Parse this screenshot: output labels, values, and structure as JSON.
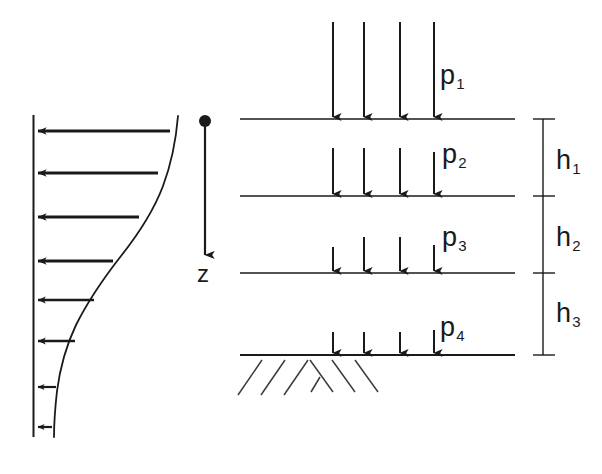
{
  "figure": {
    "stroke_color": "#1a1a1a",
    "background_color": "#ffffff"
  },
  "velocity_profile": {
    "name": "velocity-profile",
    "axis_label": "",
    "arrow_direction": "left",
    "arrow_count": 8,
    "arrows": [
      {
        "y": 131,
        "tip_x": 38,
        "tail_x": 170,
        "head": 9,
        "width": 3.0
      },
      {
        "y": 173,
        "tip_x": 38,
        "tail_x": 158,
        "head": 9,
        "width": 3.0
      },
      {
        "y": 217,
        "tip_x": 38,
        "tail_x": 139,
        "head": 8,
        "width": 2.8
      },
      {
        "y": 261,
        "tip_x": 38,
        "tail_x": 113,
        "head": 8,
        "width": 2.8
      },
      {
        "y": 300,
        "tip_x": 38,
        "tail_x": 94,
        "head": 7,
        "width": 2.6
      },
      {
        "y": 341,
        "tip_x": 38,
        "tail_x": 75,
        "head": 6,
        "width": 2.4
      },
      {
        "y": 387,
        "tip_x": 38,
        "tail_x": 56,
        "head": 5,
        "width": 2.2
      },
      {
        "y": 427,
        "tip_x": 38,
        "tail_x": 52,
        "head": 5,
        "width": 2.2
      }
    ]
  },
  "z_axis": {
    "name": "z-axis",
    "label": "z",
    "origin_marker": "filled-dot",
    "direction": "down"
  },
  "pressure_layers": {
    "name": "pressure-layers",
    "layers": [
      {
        "label": "p",
        "subscript": "1",
        "arrow_top": 22,
        "arrow_bottom": 117,
        "label_x": 440,
        "label_y": 62
      },
      {
        "label": "p",
        "subscript": "2",
        "arrow_top": 148,
        "arrow_bottom": 194,
        "label_x": 442,
        "label_y": 141
      },
      {
        "label": "p",
        "subscript": "3",
        "arrow_top": 237,
        "arrow_bottom": 271,
        "label_x": 442,
        "label_y": 224
      },
      {
        "label": "p",
        "subscript": "4",
        "arrow_top": 330,
        "arrow_bottom": 353,
        "label_x": 440,
        "label_y": 314
      }
    ],
    "arrow_columns_x": [
      333,
      364,
      400,
      434
    ],
    "boundary_lines_y": [
      119,
      196,
      273,
      355
    ],
    "boundary_line_x_start": 240,
    "boundary_line_x_end": 515
  },
  "dimensions": {
    "name": "layer-thickness-dimensions",
    "line_x": 543,
    "ticks_y": [
      119,
      196,
      273,
      355
    ],
    "items": [
      {
        "label": "h",
        "subscript": "1",
        "label_x": 556,
        "label_y": 147
      },
      {
        "label": "h",
        "subscript": "2",
        "label_x": 556,
        "label_y": 224
      },
      {
        "label": "h",
        "subscript": "3",
        "label_x": 556,
        "label_y": 300
      }
    ]
  },
  "ground_hatching": {
    "name": "ground-hatching",
    "base_line_y": 355,
    "description": "diagonal hatch marks below ground line"
  }
}
